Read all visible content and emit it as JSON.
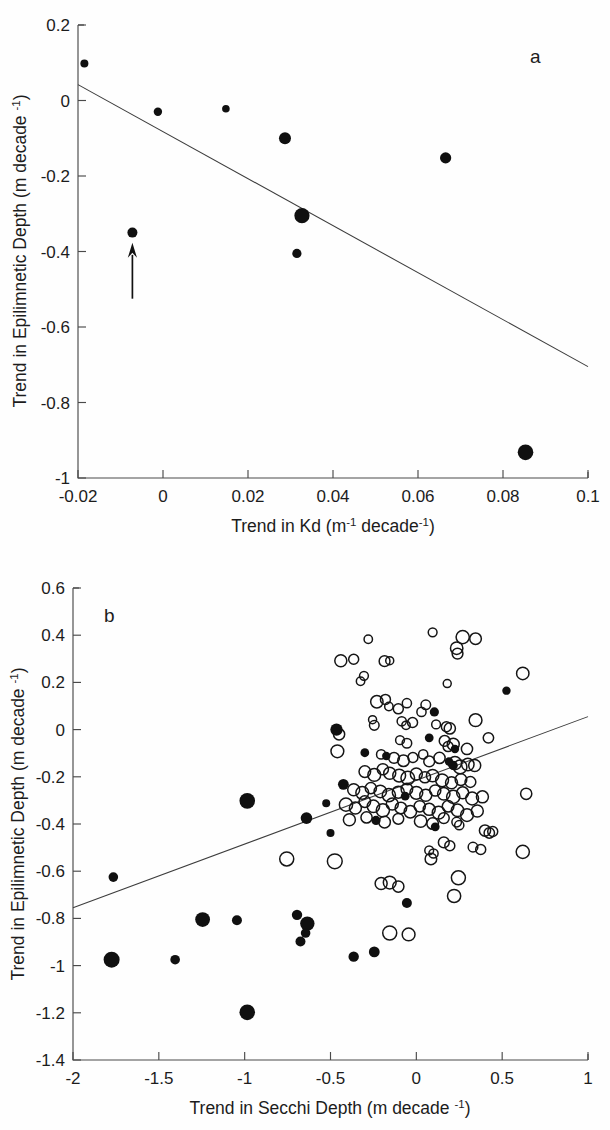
{
  "figure": {
    "width": 610,
    "height": 1130,
    "background": "#ffffff",
    "ink_color": "#111111",
    "line_color": "#3d3d3d"
  },
  "chart_data": [
    {
      "type": "scatter",
      "panel_label": "a",
      "title": "",
      "xlabel": "Trend in Kd (m-1 decade-1)",
      "xlabel_parts": {
        "pre": "Trend in Kd (m",
        "sup1": "-1",
        "mid": " decade",
        "sup2": "-1",
        "post": ")"
      },
      "ylabel": "Trend in Epilimnetic Depth (m decade -1)",
      "ylabel_parts": {
        "pre": "Trend in Epilimnetic Depth (m decade ",
        "sup": "-1",
        "post": ")"
      },
      "xlim": [
        -0.02,
        0.1
      ],
      "ylim": [
        -1.0,
        0.2
      ],
      "xticks": [
        -0.02,
        0,
        0.02,
        0.04,
        0.06,
        0.08,
        0.1
      ],
      "xticklabels": [
        "-0.02",
        "0",
        "0.02",
        "0.04",
        "0.06",
        "0.08",
        "0.1"
      ],
      "yticks": [
        0.2,
        0,
        -0.2,
        -0.4,
        -0.6,
        -0.8,
        -1
      ],
      "yticklabels": [
        "0.2",
        "0",
        "-0.2",
        "-0.4",
        "-0.6",
        "-0.8",
        "-1"
      ],
      "grid": false,
      "legend": "none",
      "marker_style": "filled-circle-variable-size",
      "points": [
        {
          "x": -0.0185,
          "y": 0.098,
          "size": 4.0
        },
        {
          "x": -0.0012,
          "y": -0.03,
          "size": 4.2
        },
        {
          "x": 0.0148,
          "y": -0.022,
          "size": 3.8
        },
        {
          "x": 0.0287,
          "y": -0.1,
          "size": 6.0
        },
        {
          "x": 0.0665,
          "y": -0.152,
          "size": 5.6
        },
        {
          "x": 0.0327,
          "y": -0.305,
          "size": 7.6
        },
        {
          "x": 0.0315,
          "y": -0.405,
          "size": 4.6
        },
        {
          "x": -0.0072,
          "y": -0.35,
          "size": 5.0
        },
        {
          "x": 0.0853,
          "y": -0.932,
          "size": 7.8
        }
      ],
      "fit_line": {
        "x1": -0.02,
        "y1": 0.042,
        "x2": 0.1,
        "y2": -0.705
      },
      "annotations": [
        {
          "kind": "arrow",
          "label": "up-arrow-annotation",
          "x": -0.0072,
          "y_tail": -0.525,
          "y_head": -0.385
        }
      ]
    },
    {
      "type": "scatter",
      "panel_label": "b",
      "title": "",
      "xlabel": "Trend in Secchi Depth (m decade -1)",
      "xlabel_parts": {
        "pre": "Trend in Secchi Depth (m decade ",
        "sup": "-1",
        "post": ")"
      },
      "ylabel": "Trend in Epilimnetic Depth (m decade -1)",
      "ylabel_parts": {
        "pre": "Trend in Epilimnetic Depth (m decade ",
        "sup": "-1",
        "post": ")"
      },
      "xlim": [
        -2,
        1
      ],
      "ylim": [
        -1.4,
        0.6
      ],
      "xticks": [
        -2,
        -1.5,
        -1,
        -0.5,
        0,
        0.5,
        1
      ],
      "xticklabels": [
        "-2",
        "-1.5",
        "-1",
        "-0.5",
        "0",
        "0.5",
        "1"
      ],
      "yticks": [
        0.6,
        0.4,
        0.2,
        0,
        -0.2,
        -0.4,
        -0.6,
        -0.8,
        -1,
        -1.2,
        -1.4
      ],
      "yticklabels": [
        "0.6",
        "0.4",
        "0.2",
        "0",
        "-0.2",
        "-0.4",
        "-0.6",
        "-0.8",
        "-1",
        "-1.2",
        "-1.4"
      ],
      "grid": false,
      "legend": "none",
      "marker_styles": [
        "open-circle-variable-size",
        "filled-circle-variable-size"
      ],
      "fit_line": {
        "x1": -2,
        "y1": -0.755,
        "x2": 1,
        "y2": 0.055
      },
      "series": [
        {
          "name": "open circles",
          "marker": "open-circle",
          "points": [
            [
              -0.28,
              0.383,
              4.2
            ],
            [
              -0.155,
              0.292,
              4.0
            ],
            [
              0.095,
              0.412,
              4.4
            ],
            [
              0.27,
              0.392,
              6.6
            ],
            [
              0.345,
              0.385,
              5.8
            ],
            [
              0.235,
              0.345,
              6.2
            ],
            [
              0.24,
              0.322,
              5.4
            ],
            [
              -0.44,
              0.292,
              6.0
            ],
            [
              -0.365,
              0.298,
              5.0
            ],
            [
              -0.185,
              0.29,
              5.4
            ],
            [
              0.62,
              0.238,
              6.2
            ],
            [
              -0.305,
              0.228,
              4.4
            ],
            [
              -0.325,
              0.205,
              4.2
            ],
            [
              0.18,
              0.195,
              4.0
            ],
            [
              -0.23,
              0.118,
              6.2
            ],
            [
              -0.18,
              0.128,
              5.0
            ],
            [
              -0.16,
              0.098,
              4.2
            ],
            [
              -0.055,
              0.112,
              4.6
            ],
            [
              -0.105,
              0.088,
              5.0
            ],
            [
              0.03,
              0.075,
              4.6
            ],
            [
              0.055,
              0.105,
              4.8
            ],
            [
              -0.255,
              0.042,
              4.0
            ],
            [
              -0.245,
              0.018,
              4.8
            ],
            [
              -0.085,
              0.035,
              4.6
            ],
            [
              -0.06,
              0.018,
              4.2
            ],
            [
              -0.022,
              0.03,
              5.0
            ],
            [
              0.115,
              0.022,
              4.4
            ],
            [
              0.175,
              0.012,
              5.0
            ],
            [
              0.195,
              0.005,
              5.6
            ],
            [
              0.345,
              0.04,
              6.4
            ],
            [
              0.42,
              -0.035,
              5.2
            ],
            [
              -0.45,
              -0.02,
              5.6
            ],
            [
              -0.46,
              -0.092,
              6.4
            ],
            [
              -0.095,
              -0.045,
              4.4
            ],
            [
              -0.055,
              -0.058,
              4.8
            ],
            [
              0.165,
              -0.048,
              5.4
            ],
            [
              0.185,
              -0.072,
              5.0
            ],
            [
              0.215,
              -0.062,
              6.0
            ],
            [
              0.295,
              -0.082,
              5.6
            ],
            [
              -0.205,
              -0.105,
              4.6
            ],
            [
              -0.13,
              -0.12,
              5.4
            ],
            [
              -0.075,
              -0.132,
              5.8
            ],
            [
              -0.02,
              -0.118,
              5.0
            ],
            [
              0.04,
              -0.105,
              4.6
            ],
            [
              0.075,
              -0.135,
              5.4
            ],
            [
              0.135,
              -0.12,
              5.6
            ],
            [
              0.225,
              -0.142,
              6.6
            ],
            [
              0.255,
              -0.158,
              6.8
            ],
            [
              0.3,
              -0.148,
              6.2
            ],
            [
              0.34,
              -0.152,
              6.0
            ],
            [
              -0.3,
              -0.178,
              5.8
            ],
            [
              -0.245,
              -0.192,
              6.4
            ],
            [
              -0.195,
              -0.168,
              5.6
            ],
            [
              -0.155,
              -0.185,
              6.0
            ],
            [
              -0.1,
              -0.195,
              6.4
            ],
            [
              -0.05,
              -0.205,
              6.8
            ],
            [
              0.0,
              -0.188,
              6.0
            ],
            [
              0.05,
              -0.202,
              5.6
            ],
            [
              0.095,
              -0.195,
              6.2
            ],
            [
              0.15,
              -0.215,
              6.4
            ],
            [
              0.205,
              -0.225,
              6.0
            ],
            [
              0.26,
              -0.212,
              5.8
            ],
            [
              0.315,
              -0.222,
              5.4
            ],
            [
              -0.365,
              -0.255,
              6.0
            ],
            [
              -0.315,
              -0.268,
              6.4
            ],
            [
              -0.265,
              -0.248,
              5.6
            ],
            [
              -0.21,
              -0.262,
              6.2
            ],
            [
              -0.16,
              -0.278,
              6.6
            ],
            [
              -0.105,
              -0.265,
              6.0
            ],
            [
              -0.055,
              -0.252,
              5.8
            ],
            [
              0.0,
              -0.268,
              6.4
            ],
            [
              0.055,
              -0.278,
              6.0
            ],
            [
              0.11,
              -0.258,
              5.6
            ],
            [
              0.16,
              -0.272,
              6.2
            ],
            [
              0.215,
              -0.285,
              6.6
            ],
            [
              0.27,
              -0.268,
              6.0
            ],
            [
              0.325,
              -0.292,
              6.4
            ],
            [
              0.385,
              -0.285,
              6.0
            ],
            [
              0.64,
              -0.272,
              5.6
            ],
            [
              -0.41,
              -0.318,
              6.6
            ],
            [
              -0.355,
              -0.332,
              6.0
            ],
            [
              -0.3,
              -0.305,
              5.8
            ],
            [
              -0.25,
              -0.325,
              6.2
            ],
            [
              -0.195,
              -0.342,
              6.6
            ],
            [
              -0.14,
              -0.315,
              6.0
            ],
            [
              -0.09,
              -0.332,
              5.8
            ],
            [
              -0.035,
              -0.348,
              6.2
            ],
            [
              0.02,
              -0.325,
              5.6
            ],
            [
              0.075,
              -0.338,
              6.0
            ],
            [
              0.13,
              -0.352,
              6.4
            ],
            [
              0.185,
              -0.325,
              5.8
            ],
            [
              0.24,
              -0.342,
              6.2
            ],
            [
              0.295,
              -0.362,
              6.4
            ],
            [
              0.355,
              -0.345,
              6.0
            ],
            [
              -0.39,
              -0.382,
              6.0
            ],
            [
              -0.29,
              -0.372,
              5.6
            ],
            [
              -0.185,
              -0.392,
              5.8
            ],
            [
              -0.105,
              -0.378,
              5.4
            ],
            [
              0.025,
              -0.388,
              6.2
            ],
            [
              0.095,
              -0.398,
              5.8
            ],
            [
              0.16,
              -0.375,
              5.4
            ],
            [
              0.235,
              -0.392,
              4.8
            ],
            [
              0.25,
              -0.405,
              4.6
            ],
            [
              0.4,
              -0.428,
              5.6
            ],
            [
              0.425,
              -0.438,
              5.2
            ],
            [
              0.445,
              -0.432,
              5.0
            ],
            [
              0.16,
              -0.478,
              5.4
            ],
            [
              0.195,
              -0.492,
              5.0
            ],
            [
              0.075,
              -0.512,
              4.4
            ],
            [
              0.1,
              -0.525,
              4.6
            ],
            [
              0.33,
              -0.498,
              4.8
            ],
            [
              0.375,
              -0.508,
              5.0
            ],
            [
              0.62,
              -0.518,
              6.6
            ],
            [
              -0.755,
              -0.548,
              7.0
            ],
            [
              -0.475,
              -0.558,
              7.4
            ],
            [
              0.085,
              -0.548,
              5.8
            ],
            [
              0.245,
              -0.628,
              7.0
            ],
            [
              -0.205,
              -0.652,
              6.0
            ],
            [
              -0.155,
              -0.648,
              6.4
            ],
            [
              -0.105,
              -0.665,
              5.6
            ],
            [
              0.22,
              -0.705,
              6.6
            ],
            [
              -0.155,
              -0.862,
              7.0
            ],
            [
              -0.045,
              -0.868,
              6.4
            ]
          ]
        },
        {
          "name": "filled circles",
          "marker": "filled-circle",
          "points": [
            [
              0.525,
              0.165,
              4.2
            ],
            [
              0.105,
              0.075,
              4.6
            ],
            [
              -0.465,
              0.0,
              6.2
            ],
            [
              0.075,
              -0.035,
              4.4
            ],
            [
              -0.3,
              -0.098,
              4.4
            ],
            [
              -0.175,
              -0.112,
              4.2
            ],
            [
              0.225,
              -0.082,
              4.2
            ],
            [
              0.215,
              -0.152,
              4.6
            ],
            [
              0.19,
              -0.135,
              4.2
            ],
            [
              -0.425,
              -0.232,
              5.4
            ],
            [
              -0.525,
              -0.312,
              4.0
            ],
            [
              -0.985,
              -0.302,
              7.8
            ],
            [
              -0.065,
              -0.282,
              4.4
            ],
            [
              -0.64,
              -0.375,
              5.8
            ],
            [
              -0.235,
              -0.385,
              4.6
            ],
            [
              -0.5,
              -0.438,
              4.0
            ],
            [
              0.11,
              -0.412,
              4.4
            ],
            [
              -1.765,
              -0.625,
              4.8
            ],
            [
              -0.055,
              -0.735,
              5.0
            ],
            [
              -1.245,
              -0.805,
              7.4
            ],
            [
              -1.045,
              -0.808,
              5.0
            ],
            [
              -0.695,
              -0.785,
              5.2
            ],
            [
              -0.635,
              -0.822,
              7.2
            ],
            [
              -0.645,
              -0.862,
              4.8
            ],
            [
              -0.675,
              -0.898,
              5.0
            ],
            [
              -1.775,
              -0.975,
              8.0
            ],
            [
              -1.405,
              -0.975,
              4.8
            ],
            [
              -0.365,
              -0.962,
              5.2
            ],
            [
              -0.245,
              -0.942,
              5.4
            ],
            [
              -0.985,
              -1.198,
              7.8
            ]
          ]
        }
      ]
    }
  ]
}
